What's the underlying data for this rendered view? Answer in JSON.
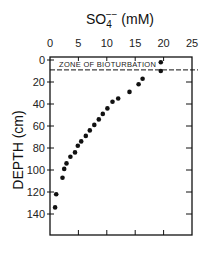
{
  "chart_data": {
    "type": "scatter",
    "title_parts": {
      "base": "SO",
      "sub": "4",
      "sup": "−−",
      "unit": " (mM)"
    },
    "xlabel": "SO4-- (mM)",
    "ylabel": "DEPTH (cm)",
    "x_axis_position": "top",
    "y_axis_inverted": true,
    "xlim": [
      0,
      25
    ],
    "ylim": [
      0,
      160
    ],
    "x_ticks": [
      0,
      5,
      10,
      15,
      20,
      25
    ],
    "x_tick_labels": [
      "0",
      "5",
      "10",
      "15",
      "20",
      "25"
    ],
    "y_ticks": [
      0,
      20,
      40,
      60,
      80,
      100,
      120,
      140
    ],
    "y_tick_labels": [
      "0",
      "20",
      "40",
      "60",
      "80",
      "100",
      "120",
      "140"
    ],
    "grid": false,
    "legend": null,
    "annotations": [
      {
        "text": "ZONE OF BIOTURBATION",
        "type": "dashed-hline",
        "depth": 9
      }
    ],
    "series": [
      {
        "name": "Sulfate",
        "points": [
          {
            "x": 19.5,
            "y": 2
          },
          {
            "x": 19.5,
            "y": 10
          },
          {
            "x": 16.3,
            "y": 17
          },
          {
            "x": 15.6,
            "y": 22
          },
          {
            "x": 14.0,
            "y": 29
          },
          {
            "x": 12.0,
            "y": 35
          },
          {
            "x": 11.0,
            "y": 38
          },
          {
            "x": 10.1,
            "y": 44
          },
          {
            "x": 9.3,
            "y": 49
          },
          {
            "x": 8.6,
            "y": 54
          },
          {
            "x": 7.8,
            "y": 59
          },
          {
            "x": 7.0,
            "y": 64
          },
          {
            "x": 6.3,
            "y": 69
          },
          {
            "x": 5.5,
            "y": 74
          },
          {
            "x": 4.9,
            "y": 78
          },
          {
            "x": 4.4,
            "y": 84
          },
          {
            "x": 3.6,
            "y": 88
          },
          {
            "x": 2.9,
            "y": 94
          },
          {
            "x": 2.5,
            "y": 99
          },
          {
            "x": 2.2,
            "y": 107
          },
          {
            "x": 1.1,
            "y": 122
          },
          {
            "x": 0.9,
            "y": 134
          }
        ]
      }
    ]
  },
  "colors": {
    "ink": "#111111",
    "background": "#ffffff"
  }
}
